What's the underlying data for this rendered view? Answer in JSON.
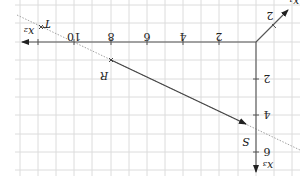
{
  "diagram": {
    "type": "3d-coordinate-system",
    "orientation": "rotated-180",
    "colors": {
      "grid": "#dcdcdc",
      "axis": "#555555",
      "vector": "#444444",
      "dotted_line": "#888888",
      "text": "#222222"
    },
    "axes": {
      "x1": {
        "label": "x₁",
        "ticks": [
          "2"
        ]
      },
      "x2": {
        "label": "x₂",
        "ticks": [
          "2",
          "4",
          "6",
          "8",
          "10"
        ]
      },
      "x3": {
        "label": "x₃",
        "ticks": [
          "2",
          "4",
          "6"
        ]
      }
    },
    "points": [
      {
        "name": "T"
      },
      {
        "name": "R"
      },
      {
        "name": "S"
      }
    ]
  }
}
